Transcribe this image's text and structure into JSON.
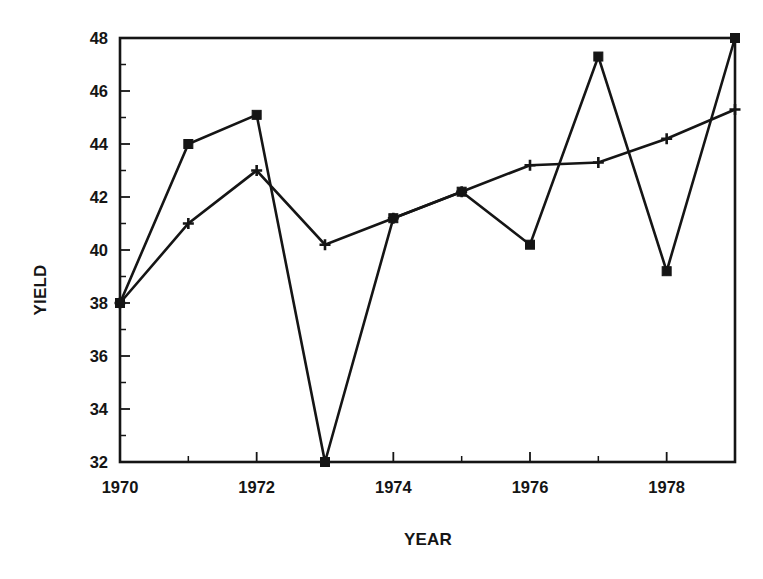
{
  "chart_data": {
    "type": "line",
    "title": "",
    "xlabel": "YEAR",
    "ylabel": "YIELD",
    "x": [
      1970,
      1971,
      1972,
      1973,
      1974,
      1975,
      1976,
      1977,
      1978,
      1979
    ],
    "xlim": [
      1970,
      1979
    ],
    "ylim": [
      32,
      48
    ],
    "grid": false,
    "legend": "none",
    "x_tick_labels": [
      "1970",
      "",
      "1972",
      "",
      "1974",
      "",
      "1976",
      "",
      "1978",
      ""
    ],
    "x_major_ticks": [
      1970,
      1972,
      1974,
      1976,
      1978
    ],
    "x_minor_ticks": [
      1971,
      1973,
      1975,
      1977,
      1979
    ],
    "y_tick_labels": [
      "32",
      "34",
      "36",
      "38",
      "40",
      "42",
      "44",
      "46",
      "48"
    ],
    "y_major_ticks": [
      32,
      34,
      36,
      38,
      40,
      42,
      44,
      46,
      48
    ],
    "y_minor_ticks": [
      33,
      35,
      37,
      39,
      41,
      43,
      45,
      47
    ],
    "series": [
      {
        "name": "square-series",
        "marker": "square",
        "values": [
          38.0,
          44.0,
          45.1,
          32.0,
          41.2,
          42.2,
          40.2,
          47.3,
          39.2,
          48.0
        ]
      },
      {
        "name": "plus-series",
        "marker": "plus",
        "values": [
          38.0,
          41.0,
          43.0,
          40.2,
          41.2,
          42.2,
          43.2,
          43.3,
          44.2,
          45.3
        ]
      }
    ],
    "colors": {
      "line": "#151515",
      "marker": "#151515",
      "background": "#ffffff"
    }
  },
  "geometry": {
    "plot_left": 120,
    "plot_right": 735,
    "plot_top": 38,
    "plot_bottom": 462,
    "tick_len_major": 10,
    "tick_len_minor": 6,
    "marker_square_size": 9,
    "marker_plus_size": 11
  }
}
